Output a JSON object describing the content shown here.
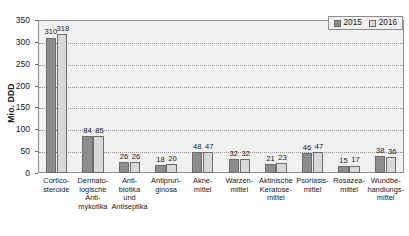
{
  "chart_data": {
    "type": "bar",
    "title": "",
    "xlabel": "",
    "ylabel": "Mio. DDD",
    "ylim": [
      0,
      350
    ],
    "yticks": [
      0,
      50,
      100,
      150,
      200,
      250,
      300,
      350
    ],
    "grid": true,
    "legend_position": "top-right",
    "categories": [
      "Cortico-\nsteroide",
      "Dermato-\nlogische\nAnti-\nmykotika",
      "Anti-\nbiotika\nund\nAntiseptika",
      "Antipruri-\nginosa",
      "Akne-\nmittel",
      "Warzen-\nmittel",
      "Aktinische\nKeratose-\nmittel",
      "Psoriasis-\nmittel",
      "Rosazea-\nmittel",
      "Wundbe-\nhandlungs-\nmittel"
    ],
    "series": [
      {
        "name": "2015",
        "color": "#8d8d8d",
        "values": [
          310,
          84,
          26,
          18,
          48,
          32,
          21,
          46,
          15,
          38
        ]
      },
      {
        "name": "2016",
        "color": "#d8d8d8",
        "values": [
          318,
          85,
          26,
          20,
          47,
          32,
          23,
          47,
          17,
          36
        ]
      }
    ]
  },
  "legend": {
    "items": [
      {
        "label": "2015",
        "swatch": "s2015"
      },
      {
        "label": "2016",
        "swatch": "s2016"
      }
    ]
  },
  "colors": {
    "series_2015": "#8d8d8d",
    "series_2016": "#d8d8d8",
    "plot_background": "#f1f1f1",
    "axis": "#8e8e8e",
    "gridline": "#9a9a9a"
  }
}
